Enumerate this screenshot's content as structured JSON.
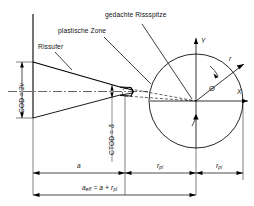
{
  "figure": {
    "type": "technical-diagram",
    "language": "de",
    "background_color": "#ffffff",
    "line_color": "#000000",
    "dashed_color": "#000000"
  },
  "labels": {
    "crack_flank": "Rissufer",
    "plastic_zone": "plastische Zone",
    "imagined_crack_tip": "gedachte Rissspitze",
    "cod": "COD = 2",
    "cod_var": "v",
    "ctod": "CTOD = ",
    "ctod_var": "δ",
    "axis_x": "X",
    "axis_y": "Y",
    "radius_ray": "r",
    "angle_theta": "Θ"
  },
  "dimensions": {
    "a": "a",
    "rpl_left": "r",
    "rpl_left_sub": "pl",
    "rpl_right": "r",
    "rpl_right_sub": "pl",
    "formula_lead": "a",
    "formula_lead_sub": "eff",
    "formula_rest": " = a + r",
    "formula_rest_sub": "pl"
  },
  "geometry": {
    "circle_center_x": 196,
    "circle_center_y": 101,
    "circle_radius": 47,
    "crack_tip_x": 196,
    "crack_tip_y": 101,
    "notch_left_x": 33,
    "a_start_x": 33,
    "a_end_x": 125,
    "rpl_mid_x": 160,
    "rpl_end_x": 196,
    "rpl2_end_x": 243,
    "baseline_y": 173,
    "formula_y": 191,
    "theta_deg": 37
  }
}
